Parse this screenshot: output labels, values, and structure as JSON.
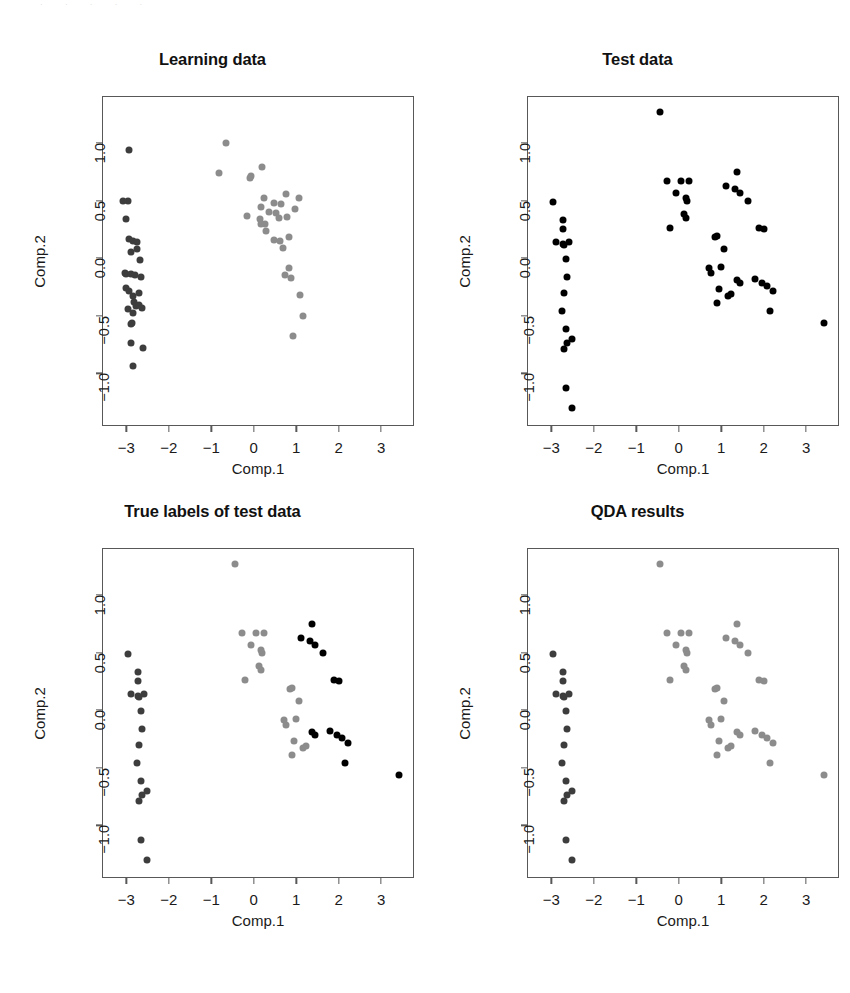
{
  "figure": {
    "layout": "2x2 grid of scatter plots",
    "scan_artifact_text": "· · · · ·"
  },
  "chart_data": [
    {
      "type": "scatter",
      "title": "Learning data",
      "xlabel": "Comp.1",
      "ylabel": "Comp.2",
      "xlim": [
        -3.55,
        3.75
      ],
      "ylim": [
        -1.45,
        1.4
      ],
      "xticks": [
        -3,
        -2,
        -1,
        0,
        1,
        2,
        3
      ],
      "xtick_labels": [
        "−3",
        "−2",
        "−1",
        "0",
        "1",
        "2",
        "3"
      ],
      "yticks": [
        -1.0,
        -0.5,
        0.0,
        0.5,
        1.0
      ],
      "ytick_labels": [
        "−1.0",
        "−0.5",
        "0.0",
        "0.5",
        "1.0"
      ],
      "grid": false,
      "legend": "none",
      "colors": {
        "group1": "#3d3d3d",
        "group2": "#8c8c8c"
      },
      "series": [
        {
          "name": "group1",
          "color": "#3d3d3d",
          "points": [
            [
              -2.93,
              0.94
            ],
            [
              -2.95,
              0.5
            ],
            [
              -3.08,
              0.5
            ],
            [
              -3.04,
              -0.13
            ],
            [
              -3.02,
              0.34
            ],
            [
              -2.93,
              0.17
            ],
            [
              -2.84,
              0.15
            ],
            [
              -2.75,
              0.14
            ],
            [
              -2.89,
              0.05
            ],
            [
              -2.67,
              -0.02
            ],
            [
              -3.01,
              -0.14
            ],
            [
              -2.88,
              -0.14
            ],
            [
              -2.79,
              -0.15
            ],
            [
              -2.66,
              -0.16
            ],
            [
              -3.0,
              -0.26
            ],
            [
              -2.93,
              -0.29
            ],
            [
              -2.85,
              -0.33
            ],
            [
              -2.82,
              -0.38
            ],
            [
              -2.78,
              -0.42
            ],
            [
              -2.7,
              -0.41
            ],
            [
              -2.63,
              -0.43
            ],
            [
              -2.84,
              -0.48
            ],
            [
              -2.86,
              -0.56
            ],
            [
              -2.89,
              -0.57
            ],
            [
              -2.88,
              -0.74
            ],
            [
              -2.6,
              -0.78
            ],
            [
              -2.85,
              -0.94
            ],
            [
              -2.74,
              0.08
            ],
            [
              -2.7,
              -0.3
            ],
            [
              -2.96,
              -0.44
            ]
          ]
        },
        {
          "name": "group2",
          "color": "#8c8c8c",
          "points": [
            [
              -0.66,
              1.0
            ],
            [
              -0.82,
              0.74
            ],
            [
              -0.06,
              0.71
            ],
            [
              -0.09,
              0.7
            ],
            [
              0.2,
              0.79
            ],
            [
              0.24,
              0.52
            ],
            [
              0.18,
              0.44
            ],
            [
              0.47,
              0.48
            ],
            [
              0.36,
              0.4
            ],
            [
              0.52,
              0.39
            ],
            [
              0.75,
              0.56
            ],
            [
              0.63,
              0.47
            ],
            [
              1.07,
              0.52
            ],
            [
              0.97,
              0.43
            ],
            [
              -0.15,
              0.37
            ],
            [
              0.14,
              0.34
            ],
            [
              0.18,
              0.3
            ],
            [
              0.78,
              0.36
            ],
            [
              0.6,
              0.35
            ],
            [
              0.27,
              0.3
            ],
            [
              0.84,
              0.18
            ],
            [
              0.47,
              0.16
            ],
            [
              0.61,
              0.15
            ],
            [
              0.69,
              0.09
            ],
            [
              0.84,
              -0.09
            ],
            [
              0.74,
              -0.15
            ],
            [
              0.87,
              -0.17
            ],
            [
              1.1,
              -0.32
            ],
            [
              0.92,
              -0.68
            ],
            [
              1.17,
              -0.5
            ],
            [
              0.3,
              0.24
            ]
          ]
        }
      ]
    },
    {
      "type": "scatter",
      "title": "Test data",
      "xlabel": "Comp.1",
      "ylabel": "Comp.2",
      "xlim": [
        -3.55,
        3.75
      ],
      "ylim": [
        -1.45,
        1.4
      ],
      "xticks": [
        -3,
        -2,
        -1,
        0,
        1,
        2,
        3
      ],
      "xtick_labels": [
        "−3",
        "−2",
        "−1",
        "0",
        "1",
        "2",
        "3"
      ],
      "yticks": [
        -1.0,
        -0.5,
        0.0,
        0.5,
        1.0
      ],
      "ytick_labels": [
        "−1.0",
        "−0.5",
        "0.0",
        "0.5",
        "1.0"
      ],
      "grid": false,
      "legend": "none",
      "colors": {
        "all": "#000000"
      },
      "series": [
        {
          "name": "all",
          "color": "#000000",
          "points": [
            [
              -0.43,
              1.27
            ],
            [
              -2.95,
              0.49
            ],
            [
              -2.73,
              0.33
            ],
            [
              -2.73,
              0.25
            ],
            [
              -2.88,
              0.14
            ],
            [
              -2.72,
              0.12
            ],
            [
              -2.7,
              0.11
            ],
            [
              -2.58,
              0.14
            ],
            [
              -2.65,
              -0.01
            ],
            [
              -2.62,
              -0.16
            ],
            [
              -2.7,
              -0.3
            ],
            [
              -2.74,
              -0.46
            ],
            [
              -2.66,
              -0.62
            ],
            [
              -2.62,
              -0.74
            ],
            [
              -2.52,
              -0.7
            ],
            [
              -2.7,
              -0.79
            ],
            [
              -2.66,
              -1.13
            ],
            [
              -2.52,
              -1.3
            ],
            [
              -0.27,
              0.67
            ],
            [
              -0.2,
              0.26
            ],
            [
              -0.07,
              0.57
            ],
            [
              0.05,
              0.67
            ],
            [
              0.2,
              0.5
            ],
            [
              0.23,
              0.67
            ],
            [
              0.17,
              0.52
            ],
            [
              0.13,
              0.38
            ],
            [
              0.17,
              0.35
            ],
            [
              0.86,
              0.18
            ],
            [
              0.91,
              0.19
            ],
            [
              1.06,
              0.08
            ],
            [
              0.72,
              -0.09
            ],
            [
              0.77,
              -0.13
            ],
            [
              1.0,
              -0.08
            ],
            [
              0.95,
              -0.27
            ],
            [
              0.9,
              -0.39
            ],
            [
              1.17,
              -0.33
            ],
            [
              1.24,
              -0.31
            ],
            [
              1.37,
              -0.19
            ],
            [
              1.45,
              -0.22
            ],
            [
              1.11,
              0.63
            ],
            [
              1.32,
              0.6
            ],
            [
              1.38,
              0.75
            ],
            [
              1.45,
              0.57
            ],
            [
              1.62,
              0.5
            ],
            [
              2.0,
              0.25
            ],
            [
              1.88,
              0.26
            ],
            [
              1.79,
              -0.18
            ],
            [
              1.97,
              -0.22
            ],
            [
              2.08,
              -0.24
            ],
            [
              2.23,
              -0.29
            ],
            [
              2.14,
              -0.46
            ],
            [
              3.43,
              -0.56
            ]
          ]
        }
      ]
    },
    {
      "type": "scatter",
      "title": "True labels of test data",
      "xlabel": "Comp.1",
      "ylabel": "Comp.2",
      "xlim": [
        -3.55,
        3.75
      ],
      "ylim": [
        -1.45,
        1.4
      ],
      "xticks": [
        -3,
        -2,
        -1,
        0,
        1,
        2,
        3
      ],
      "xtick_labels": [
        "−3",
        "−2",
        "−1",
        "0",
        "1",
        "2",
        "3"
      ],
      "yticks": [
        -1.0,
        -0.5,
        0.0,
        0.5,
        1.0
      ],
      "ytick_labels": [
        "−1.0",
        "−0.5",
        "0.0",
        "0.5",
        "1.0"
      ],
      "grid": false,
      "legend": "none",
      "colors": {
        "group1": "#3d3d3d",
        "group2": "#8c8c8c",
        "group3": "#000000"
      },
      "series": [
        {
          "name": "group1",
          "color": "#3d3d3d",
          "points": [
            [
              -2.95,
              0.49
            ],
            [
              -2.73,
              0.33
            ],
            [
              -2.73,
              0.25
            ],
            [
              -2.88,
              0.14
            ],
            [
              -2.72,
              0.12
            ],
            [
              -2.7,
              0.11
            ],
            [
              -2.58,
              0.14
            ],
            [
              -2.65,
              -0.01
            ],
            [
              -2.62,
              -0.16
            ],
            [
              -2.7,
              -0.3
            ],
            [
              -2.74,
              -0.46
            ],
            [
              -2.66,
              -0.62
            ],
            [
              -2.62,
              -0.74
            ],
            [
              -2.52,
              -0.7
            ],
            [
              -2.7,
              -0.79
            ],
            [
              -2.66,
              -1.13
            ],
            [
              -2.52,
              -1.3
            ]
          ]
        },
        {
          "name": "group2",
          "color": "#8c8c8c",
          "points": [
            [
              -0.43,
              1.27
            ],
            [
              -0.27,
              0.67
            ],
            [
              -0.2,
              0.26
            ],
            [
              -0.07,
              0.57
            ],
            [
              0.05,
              0.67
            ],
            [
              0.2,
              0.5
            ],
            [
              0.23,
              0.67
            ],
            [
              0.17,
              0.52
            ],
            [
              0.13,
              0.38
            ],
            [
              0.17,
              0.35
            ],
            [
              0.86,
              0.18
            ],
            [
              0.91,
              0.19
            ],
            [
              1.06,
              0.08
            ],
            [
              0.72,
              -0.09
            ],
            [
              0.77,
              -0.13
            ],
            [
              1.0,
              -0.08
            ],
            [
              0.95,
              -0.27
            ],
            [
              0.9,
              -0.39
            ],
            [
              1.17,
              -0.33
            ],
            [
              1.24,
              -0.31
            ]
          ]
        },
        {
          "name": "group3",
          "color": "#000000",
          "points": [
            [
              1.11,
              0.63
            ],
            [
              1.32,
              0.6
            ],
            [
              1.38,
              0.75
            ],
            [
              1.45,
              0.57
            ],
            [
              1.62,
              0.5
            ],
            [
              2.0,
              0.25
            ],
            [
              1.88,
              0.26
            ],
            [
              1.79,
              -0.18
            ],
            [
              1.97,
              -0.22
            ],
            [
              2.08,
              -0.24
            ],
            [
              2.23,
              -0.29
            ],
            [
              2.14,
              -0.46
            ],
            [
              1.37,
              -0.19
            ],
            [
              1.45,
              -0.22
            ],
            [
              3.43,
              -0.56
            ]
          ]
        }
      ]
    },
    {
      "type": "scatter",
      "title": "QDA results",
      "xlabel": "Comp.1",
      "ylabel": "Comp.2",
      "xlim": [
        -3.55,
        3.75
      ],
      "ylim": [
        -1.45,
        1.4
      ],
      "xticks": [
        -3,
        -2,
        -1,
        0,
        1,
        2,
        3
      ],
      "xtick_labels": [
        "−3",
        "−2",
        "−1",
        "0",
        "1",
        "2",
        "3"
      ],
      "yticks": [
        -1.0,
        -0.5,
        0.0,
        0.5,
        1.0
      ],
      "ytick_labels": [
        "−1.0",
        "−0.5",
        "0.0",
        "0.5",
        "1.0"
      ],
      "grid": false,
      "legend": "none",
      "colors": {
        "group1": "#3d3d3d",
        "group2": "#8c8c8c"
      },
      "series": [
        {
          "name": "group1",
          "color": "#3d3d3d",
          "points": [
            [
              -2.95,
              0.49
            ],
            [
              -2.73,
              0.33
            ],
            [
              -2.73,
              0.25
            ],
            [
              -2.88,
              0.14
            ],
            [
              -2.72,
              0.12
            ],
            [
              -2.7,
              0.11
            ],
            [
              -2.58,
              0.14
            ],
            [
              -2.65,
              -0.01
            ],
            [
              -2.62,
              -0.16
            ],
            [
              -2.7,
              -0.3
            ],
            [
              -2.74,
              -0.46
            ],
            [
              -2.66,
              -0.62
            ],
            [
              -2.62,
              -0.74
            ],
            [
              -2.52,
              -0.7
            ],
            [
              -2.7,
              -0.79
            ],
            [
              -2.66,
              -1.13
            ],
            [
              -2.52,
              -1.3
            ]
          ]
        },
        {
          "name": "group2",
          "color": "#8c8c8c",
          "points": [
            [
              -0.43,
              1.27
            ],
            [
              -0.27,
              0.67
            ],
            [
              -0.2,
              0.26
            ],
            [
              -0.07,
              0.57
            ],
            [
              0.05,
              0.67
            ],
            [
              0.2,
              0.5
            ],
            [
              0.23,
              0.67
            ],
            [
              0.17,
              0.52
            ],
            [
              0.13,
              0.38
            ],
            [
              0.17,
              0.35
            ],
            [
              0.86,
              0.18
            ],
            [
              0.91,
              0.19
            ],
            [
              1.06,
              0.08
            ],
            [
              0.72,
              -0.09
            ],
            [
              0.77,
              -0.13
            ],
            [
              1.0,
              -0.08
            ],
            [
              0.95,
              -0.27
            ],
            [
              0.9,
              -0.39
            ],
            [
              1.17,
              -0.33
            ],
            [
              1.24,
              -0.31
            ],
            [
              1.11,
              0.63
            ],
            [
              1.32,
              0.6
            ],
            [
              1.38,
              0.75
            ],
            [
              1.45,
              0.57
            ],
            [
              1.62,
              0.5
            ],
            [
              2.0,
              0.25
            ],
            [
              1.88,
              0.26
            ],
            [
              1.79,
              -0.18
            ],
            [
              1.97,
              -0.22
            ],
            [
              2.08,
              -0.24
            ],
            [
              2.23,
              -0.29
            ],
            [
              2.14,
              -0.46
            ],
            [
              1.37,
              -0.19
            ],
            [
              1.45,
              -0.22
            ],
            [
              3.43,
              -0.56
            ]
          ]
        }
      ]
    }
  ]
}
